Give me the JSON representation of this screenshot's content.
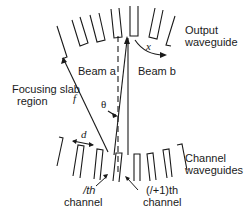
{
  "labels": {
    "output_waveguide_line1": "Output",
    "output_waveguide_line2": "waveguide",
    "beam_a": "Beam a",
    "beam_b": "Beam b",
    "focusing_slab_line1": "Focusing slab",
    "focusing_slab_line2": "region",
    "channel_waveguides_line1": "Channel",
    "channel_waveguides_line2": "waveguides",
    "ith_channel_line1": "/th",
    "ith_channel_line2": "channel",
    "i1th_channel_line1": "(/+1)th",
    "i1th_channel_line2": "channel"
  },
  "symbols": {
    "focal_length": "f",
    "pitch": "d",
    "angle": "θ",
    "displacement": "x"
  },
  "colors": {
    "line": "#1a1a1a",
    "background": "#ffffff"
  }
}
